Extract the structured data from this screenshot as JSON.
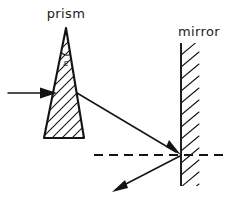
{
  "figure": {
    "title_prism": "prism",
    "title_mirror": "mirror",
    "angle_symbol": "ε",
    "colors": {
      "ink": "#141414",
      "paper": "#ffffff"
    },
    "elements": {
      "incoming_ray_name": "incident-ray",
      "refracted_ray_name": "refracted-ray",
      "reflected_ray_name": "reflected-ray",
      "axis_name": "optical-axis-dashed",
      "prism_name": "prism-shape",
      "mirror_name": "mirror-surface"
    }
  }
}
